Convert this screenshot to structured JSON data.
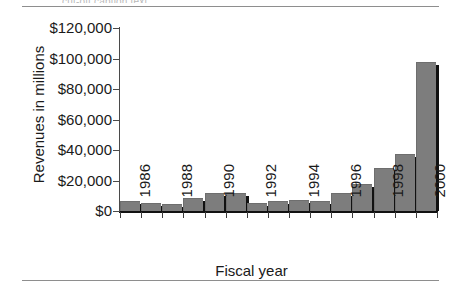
{
  "page": {
    "caption_fragment": "cut-off caption text",
    "rules": [
      "top-rule",
      "bottom-rule"
    ]
  },
  "chart_data": {
    "type": "bar",
    "title": "",
    "xlabel": "Fiscal year",
    "ylabel": "Revenues in millions",
    "categories": [
      "1986",
      "1987",
      "1988",
      "1989",
      "1990",
      "1991",
      "1992",
      "1993",
      "1994",
      "1995",
      "1996",
      "1997",
      "1998",
      "1999",
      "2000"
    ],
    "tick_labels_shown": [
      "1986",
      "1988",
      "1990",
      "1992",
      "1994",
      "1996",
      "1998",
      "2000"
    ],
    "values": [
      6500,
      5500,
      4500,
      8500,
      11500,
      12000,
      5000,
      6500,
      7000,
      6800,
      11500,
      18000,
      28500,
      37500,
      98000
    ],
    "ylim": [
      0,
      120000
    ],
    "ytick_values": [
      0,
      20000,
      40000,
      60000,
      80000,
      100000,
      120000
    ],
    "ytick_labels": [
      "$0",
      "$20,000",
      "$40,000",
      "$60,000",
      "$80,000",
      "$100,000",
      "$120,000"
    ],
    "grid": false,
    "legend": "none",
    "bar_color": "#7d7d7d",
    "bar_shadow_color": "#111111",
    "axis_color": "#111111"
  }
}
